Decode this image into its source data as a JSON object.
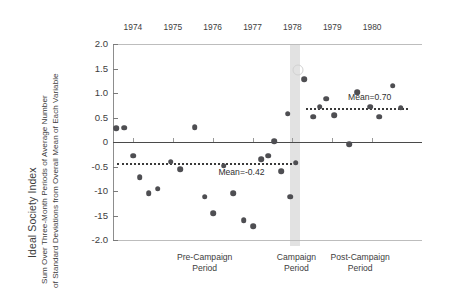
{
  "chart_data": {
    "type": "scatter",
    "title": "",
    "ylabel": "Ideal Society Index",
    "ylabel_sub_line1": "Sum Over Three-Month Periods of Average Number",
    "ylabel_sub_line2": "of Standard Deviations from Overall Mean of Each Variable",
    "xlabel": "",
    "ylim": [
      -2.0,
      2.0
    ],
    "xlim": [
      1973.5,
      1981.2
    ],
    "grid": false,
    "legend": "none",
    "ytick_labels": [
      "2.0",
      "1.5",
      "1.0",
      "0.5",
      "0",
      "-0.5",
      "-10",
      "-15",
      "-2.0"
    ],
    "ytick_values": [
      2.0,
      1.5,
      1.0,
      0.5,
      0,
      -0.5,
      -1.0,
      -1.5,
      -2.0
    ],
    "xtick_labels": [
      "1974",
      "1975",
      "1976",
      "1977",
      "1978",
      "1979",
      "1980"
    ],
    "xtick_values": [
      1974,
      1975,
      1976,
      1977,
      1978,
      1979,
      1980
    ],
    "zero_reference_line": 0,
    "annotations": [
      {
        "name": "mean-pre",
        "text": "Mean=-0.42",
        "value": -0.42,
        "x_start": 1973.6,
        "x_end": 1978.0
      },
      {
        "name": "mean-post",
        "text": "Mean=0.70",
        "value": 0.7,
        "x_start": 1978.35,
        "x_end": 1980.9
      }
    ],
    "shaded_band": {
      "name": "campaign-band",
      "x_start": 1977.95,
      "x_end": 1978.2,
      "color": "#e2e2e2"
    },
    "period_labels": [
      {
        "line1": "Pre-Campaign",
        "line2": "Period",
        "x": 1975.8
      },
      {
        "line1": "Campaign",
        "line2": "Period",
        "x": 1978.1
      },
      {
        "line1": "Post-Campaign",
        "line2": "Period",
        "x": 1979.7
      }
    ],
    "series": [
      {
        "name": "Ideal Society Index",
        "marker": "filled-circle",
        "color": "#4e4e52",
        "points": [
          {
            "x": 1973.58,
            "y": 0.28
          },
          {
            "x": 1973.78,
            "y": 0.29
          },
          {
            "x": 1974.0,
            "y": -0.28
          },
          {
            "x": 1974.17,
            "y": -0.72
          },
          {
            "x": 1974.4,
            "y": -1.05
          },
          {
            "x": 1974.62,
            "y": -0.95
          },
          {
            "x": 1974.95,
            "y": -0.4
          },
          {
            "x": 1975.18,
            "y": -0.55
          },
          {
            "x": 1975.55,
            "y": 0.3
          },
          {
            "x": 1975.8,
            "y": -1.12
          },
          {
            "x": 1976.02,
            "y": -1.45
          },
          {
            "x": 1976.28,
            "y": -0.48
          },
          {
            "x": 1976.52,
            "y": -1.05
          },
          {
            "x": 1976.78,
            "y": -1.6
          },
          {
            "x": 1977.02,
            "y": -1.72
          },
          {
            "x": 1977.22,
            "y": -0.35
          },
          {
            "x": 1977.4,
            "y": -0.28
          },
          {
            "x": 1977.55,
            "y": 0.02
          },
          {
            "x": 1977.72,
            "y": -0.6
          },
          {
            "x": 1977.88,
            "y": 0.58
          },
          {
            "x": 1977.95,
            "y": -1.12
          },
          {
            "x": 1978.08,
            "y": -0.42
          },
          {
            "x": 1978.3,
            "y": 1.28
          },
          {
            "x": 1978.52,
            "y": 0.52
          },
          {
            "x": 1978.68,
            "y": 0.72
          },
          {
            "x": 1978.85,
            "y": 0.88
          },
          {
            "x": 1979.05,
            "y": 0.55
          },
          {
            "x": 1979.42,
            "y": -0.05
          },
          {
            "x": 1979.62,
            "y": 1.02
          },
          {
            "x": 1979.95,
            "y": 0.72
          },
          {
            "x": 1980.18,
            "y": 0.52
          },
          {
            "x": 1980.52,
            "y": 1.15
          },
          {
            "x": 1980.72,
            "y": 0.7
          }
        ]
      },
      {
        "name": "highlighted-open-point",
        "marker": "open-circle",
        "color": "#d2d2d2",
        "points": [
          {
            "x": 1978.14,
            "y": 1.46
          }
        ]
      }
    ]
  }
}
